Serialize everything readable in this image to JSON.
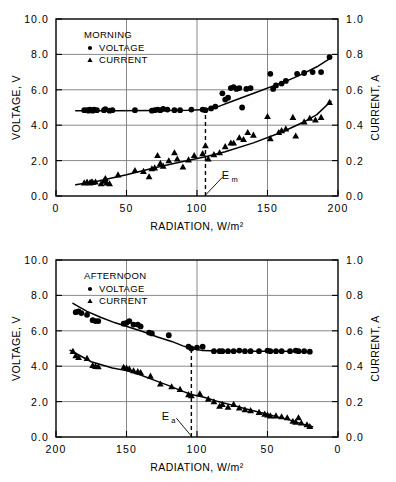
{
  "figure": {
    "title": "",
    "panel_count": 2
  },
  "chart_data": [
    {
      "id": "morning",
      "type": "scatter",
      "title": "",
      "legend_title": "MORNING",
      "legend_position": "top-left-inside",
      "legend": [
        {
          "name": "VOLTAGE",
          "marker": "circle",
          "axis": "left"
        },
        {
          "name": "CURRENT",
          "marker": "triangle",
          "axis": "right"
        }
      ],
      "xlabel": "RADIATION, W/m²",
      "xlim": [
        0,
        200
      ],
      "xticks": [
        0,
        50,
        100,
        150,
        200
      ],
      "xticklabels": [
        "0",
        "50",
        "100",
        "150",
        "200"
      ],
      "x_reversed": false,
      "ylabel_left": "VOLTAGE, V",
      "ylim_left": [
        0.0,
        10.0
      ],
      "yticks_left": [
        0.0,
        2.0,
        4.0,
        6.0,
        8.0,
        10.0
      ],
      "yticklabels_left": [
        "0.0",
        "2.0",
        "4.0",
        "6.0",
        "8.0",
        "10.0"
      ],
      "ylabel_right": "CURRENT, A",
      "ylim_right": [
        0.0,
        1.0
      ],
      "yticks_right": [
        0.0,
        0.2,
        0.4,
        0.6,
        0.8,
        1.0
      ],
      "yticklabels_right": [
        "0.0",
        "0.2",
        "0.4",
        "0.6",
        "0.8",
        "1.0"
      ],
      "grid": true,
      "annotation": {
        "label": "E",
        "subscript": "m",
        "x": 106,
        "line_from_y": 0.0,
        "line_to_y": 5.0
      },
      "series": [
        {
          "name": "VOLTAGE",
          "axis": "left",
          "marker": "circle",
          "points": [
            [
              20,
              4.85
            ],
            [
              22,
              4.85
            ],
            [
              23,
              4.82
            ],
            [
              24,
              4.88
            ],
            [
              25,
              4.85
            ],
            [
              26,
              4.82
            ],
            [
              27,
              4.88
            ],
            [
              29,
              4.85
            ],
            [
              34,
              4.85
            ],
            [
              35,
              4.9
            ],
            [
              38,
              4.82
            ],
            [
              40,
              4.85
            ],
            [
              56,
              4.85
            ],
            [
              68,
              4.82
            ],
            [
              70,
              4.85
            ],
            [
              72,
              4.88
            ],
            [
              74,
              4.85
            ],
            [
              76,
              4.92
            ],
            [
              79,
              4.88
            ],
            [
              84,
              4.85
            ],
            [
              88,
              4.85
            ],
            [
              96,
              4.88
            ],
            [
              104,
              4.88
            ],
            [
              106,
              4.85
            ],
            [
              110,
              4.95
            ],
            [
              113,
              5.05
            ],
            [
              118,
              5.8
            ],
            [
              120,
              5.45
            ],
            [
              122,
              5.55
            ],
            [
              124,
              6.1
            ],
            [
              126,
              6.15
            ],
            [
              128,
              6.05
            ],
            [
              130,
              6.1
            ],
            [
              132,
              5.0
            ],
            [
              135,
              6.05
            ],
            [
              138,
              6.1
            ],
            [
              152,
              6.9
            ],
            [
              154,
              6.05
            ],
            [
              156,
              6.25
            ],
            [
              160,
              6.35
            ],
            [
              163,
              6.5
            ],
            [
              171,
              6.9
            ],
            [
              176,
              6.95
            ],
            [
              182,
              7.0
            ],
            [
              188,
              7.0
            ],
            [
              194,
              7.85
            ]
          ],
          "fit": [
            [
              14,
              4.82
            ],
            [
              40,
              4.82
            ],
            [
              70,
              4.83
            ],
            [
              95,
              4.85
            ],
            [
              106,
              4.88
            ],
            [
              115,
              5.05
            ],
            [
              125,
              5.35
            ],
            [
              135,
              5.65
            ],
            [
              145,
              5.95
            ],
            [
              155,
              6.25
            ],
            [
              165,
              6.55
            ],
            [
              175,
              6.9
            ],
            [
              185,
              7.3
            ],
            [
              195,
              7.8
            ]
          ]
        },
        {
          "name": "CURRENT",
          "axis": "right",
          "marker": "triangle",
          "points": [
            [
              20,
              0.075
            ],
            [
              22,
              0.08
            ],
            [
              24,
              0.075
            ],
            [
              25,
              0.08
            ],
            [
              26,
              0.078
            ],
            [
              28,
              0.08
            ],
            [
              32,
              0.07
            ],
            [
              34,
              0.085
            ],
            [
              35,
              0.1
            ],
            [
              36,
              0.075
            ],
            [
              38,
              0.07
            ],
            [
              44,
              0.12
            ],
            [
              56,
              0.145
            ],
            [
              62,
              0.14
            ],
            [
              66,
              0.11
            ],
            [
              68,
              0.155
            ],
            [
              70,
              0.16
            ],
            [
              72,
              0.23
            ],
            [
              74,
              0.185
            ],
            [
              76,
              0.17
            ],
            [
              80,
              0.2
            ],
            [
              84,
              0.245
            ],
            [
              86,
              0.21
            ],
            [
              90,
              0.165
            ],
            [
              94,
              0.205
            ],
            [
              98,
              0.23
            ],
            [
              104,
              0.24
            ],
            [
              106,
              0.285
            ],
            [
              108,
              0.21
            ],
            [
              112,
              0.235
            ],
            [
              116,
              0.245
            ],
            [
              120,
              0.28
            ],
            [
              124,
              0.3
            ],
            [
              126,
              0.3
            ],
            [
              130,
              0.33
            ],
            [
              133,
              0.32
            ],
            [
              136,
              0.36
            ],
            [
              140,
              0.345
            ],
            [
              150,
              0.45
            ],
            [
              152,
              0.325
            ],
            [
              158,
              0.36
            ],
            [
              160,
              0.37
            ],
            [
              163,
              0.38
            ],
            [
              168,
              0.445
            ],
            [
              170,
              0.34
            ],
            [
              176,
              0.42
            ],
            [
              180,
              0.44
            ],
            [
              184,
              0.43
            ],
            [
              188,
              0.445
            ],
            [
              194,
              0.53
            ]
          ],
          "fit": [
            [
              14,
              0.063
            ],
            [
              30,
              0.085
            ],
            [
              50,
              0.12
            ],
            [
              70,
              0.16
            ],
            [
              90,
              0.195
            ],
            [
              106,
              0.222
            ],
            [
              120,
              0.25
            ],
            [
              140,
              0.3
            ],
            [
              160,
              0.36
            ],
            [
              175,
              0.415
            ],
            [
              185,
              0.46
            ],
            [
              195,
              0.535
            ]
          ]
        }
      ]
    },
    {
      "id": "afternoon",
      "type": "scatter",
      "title": "",
      "legend_title": "AFTERNOON",
      "legend_position": "top-left-inside",
      "legend": [
        {
          "name": "VOLTAGE",
          "marker": "circle",
          "axis": "left"
        },
        {
          "name": "CURRENT",
          "marker": "triangle",
          "axis": "right"
        }
      ],
      "xlabel": "RADIATION, W/m²",
      "xlim": [
        0,
        200
      ],
      "xticks": [
        200,
        150,
        100,
        50,
        0
      ],
      "xticklabels": [
        "200",
        "150",
        "100",
        "50",
        "0"
      ],
      "x_reversed": true,
      "ylabel_left": "VOLTAGE, V",
      "ylim_left": [
        0.0,
        10.0
      ],
      "yticks_left": [
        0.0,
        2.0,
        4.0,
        6.0,
        8.0,
        10.0
      ],
      "yticklabels_left": [
        "0.0",
        "2.0",
        "4.0",
        "6.0",
        "8.0",
        "10.0"
      ],
      "ylabel_right": "CURRENT, A",
      "ylim_right": [
        0.0,
        1.0
      ],
      "yticks_right": [
        0.0,
        0.2,
        0.4,
        0.6,
        0.8,
        1.0
      ],
      "yticklabels_right": [
        "0.0",
        "0.2",
        "0.4",
        "0.6",
        "0.8",
        "1.0"
      ],
      "grid": true,
      "annotation": {
        "label": "E",
        "subscript": "a",
        "x": 104,
        "line_from_y": 0.0,
        "line_to_y": 5.0
      },
      "series": [
        {
          "name": "VOLTAGE",
          "axis": "left",
          "marker": "circle",
          "points": [
            [
              186,
              7.05
            ],
            [
              184,
              7.1
            ],
            [
              182,
              7.0
            ],
            [
              178,
              6.9
            ],
            [
              174,
              6.6
            ],
            [
              172,
              6.55
            ],
            [
              170,
              6.55
            ],
            [
              152,
              6.4
            ],
            [
              150,
              6.45
            ],
            [
              148,
              6.55
            ],
            [
              145,
              6.35
            ],
            [
              142,
              6.35
            ],
            [
              140,
              6.25
            ],
            [
              134,
              5.9
            ],
            [
              132,
              5.85
            ],
            [
              120,
              5.75
            ],
            [
              106,
              5.1
            ],
            [
              104,
              5.0
            ],
            [
              100,
              5.05
            ],
            [
              96,
              5.1
            ],
            [
              88,
              4.85
            ],
            [
              84,
              4.85
            ],
            [
              82,
              4.85
            ],
            [
              78,
              4.85
            ],
            [
              74,
              4.85
            ],
            [
              70,
              4.88
            ],
            [
              66,
              4.85
            ],
            [
              62,
              4.85
            ],
            [
              56,
              4.85
            ],
            [
              50,
              4.88
            ],
            [
              48,
              4.85
            ],
            [
              44,
              4.85
            ],
            [
              40,
              4.85
            ],
            [
              34,
              4.85
            ],
            [
              30,
              4.88
            ],
            [
              28,
              4.85
            ],
            [
              24,
              4.85
            ],
            [
              20,
              4.82
            ]
          ],
          "fit": [
            [
              188,
              7.55
            ],
            [
              178,
              7.1
            ],
            [
              168,
              6.75
            ],
            [
              158,
              6.45
            ],
            [
              148,
              6.2
            ],
            [
              138,
              5.95
            ],
            [
              128,
              5.65
            ],
            [
              118,
              5.4
            ],
            [
              110,
              5.15
            ],
            [
              104,
              5.0
            ],
            [
              96,
              4.88
            ],
            [
              80,
              4.85
            ],
            [
              60,
              4.85
            ],
            [
              40,
              4.85
            ],
            [
              22,
              4.82
            ]
          ]
        },
        {
          "name": "CURRENT",
          "axis": "right",
          "marker": "triangle",
          "points": [
            [
              188,
              0.485
            ],
            [
              186,
              0.46
            ],
            [
              184,
              0.45
            ],
            [
              178,
              0.445
            ],
            [
              174,
              0.405
            ],
            [
              172,
              0.4
            ],
            [
              170,
              0.398
            ],
            [
              152,
              0.395
            ],
            [
              150,
              0.39
            ],
            [
              148,
              0.385
            ],
            [
              145,
              0.375
            ],
            [
              142,
              0.37
            ],
            [
              140,
              0.365
            ],
            [
              133,
              0.345
            ],
            [
              126,
              0.3
            ],
            [
              118,
              0.285
            ],
            [
              112,
              0.27
            ],
            [
              106,
              0.24
            ],
            [
              104,
              0.235
            ],
            [
              98,
              0.245
            ],
            [
              92,
              0.215
            ],
            [
              88,
              0.2
            ],
            [
              84,
              0.175
            ],
            [
              82,
              0.185
            ],
            [
              78,
              0.17
            ],
            [
              74,
              0.185
            ],
            [
              70,
              0.165
            ],
            [
              66,
              0.155
            ],
            [
              62,
              0.15
            ],
            [
              56,
              0.14
            ],
            [
              52,
              0.13
            ],
            [
              50,
              0.125
            ],
            [
              48,
              0.12
            ],
            [
              44,
              0.12
            ],
            [
              40,
              0.115
            ],
            [
              36,
              0.11
            ],
            [
              32,
              0.09
            ],
            [
              30,
              0.085
            ],
            [
              28,
              0.11
            ],
            [
              26,
              0.08
            ],
            [
              22,
              0.07
            ],
            [
              20,
              0.06
            ]
          ],
          "fit": [
            [
              190,
              0.49
            ],
            [
              175,
              0.425
            ],
            [
              160,
              0.39
            ],
            [
              150,
              0.375
            ],
            [
              140,
              0.35
            ],
            [
              130,
              0.32
            ],
            [
              120,
              0.29
            ],
            [
              110,
              0.258
            ],
            [
              104,
              0.24
            ],
            [
              95,
              0.225
            ],
            [
              85,
              0.2
            ],
            [
              75,
              0.18
            ],
            [
              65,
              0.158
            ],
            [
              55,
              0.138
            ],
            [
              45,
              0.118
            ],
            [
              35,
              0.098
            ],
            [
              25,
              0.072
            ],
            [
              18,
              0.058
            ]
          ]
        }
      ]
    }
  ]
}
